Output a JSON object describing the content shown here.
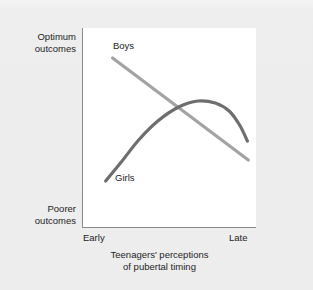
{
  "figure": {
    "background_color": "#eeeeee",
    "plot_background_color": "#ffffff",
    "axis_color": "#8a8a8a"
  },
  "axes": {
    "y_top_label_line1": "Optimum",
    "y_top_label_line2": "outcomes",
    "y_bottom_label_line1": "Poorer",
    "y_bottom_label_line2": "outcomes",
    "x_tick_left": "Early",
    "x_tick_right": "Late",
    "x_title_line1": "Teenagers' perceptions",
    "x_title_line2": "of pubertal timing"
  },
  "series_labels": {
    "boys": "Boys",
    "girls": "Girls"
  },
  "chart_data": {
    "type": "line",
    "title": "",
    "subtitle": "",
    "xlabel": "Teenagers' perceptions of pubertal timing",
    "ylabel": "Outcomes",
    "xlim": [
      0,
      1
    ],
    "ylim": [
      0,
      1
    ],
    "grid": false,
    "legend": "inline-labels",
    "xticklabels": [
      "Early",
      "Late"
    ],
    "yticklabels": [
      "Poorer outcomes",
      "Optimum outcomes"
    ],
    "annotations": [
      {
        "text": "Boys",
        "x": 0.2,
        "y": 0.9
      },
      {
        "text": "Girls",
        "x": 0.2,
        "y": 0.27
      }
    ],
    "series": [
      {
        "name": "Boys",
        "color": "#a3a3a3",
        "linewidth": 3.2,
        "shape": "straight-decreasing",
        "x": [
          0.17,
          0.3,
          0.43,
          0.56,
          0.69,
          0.82,
          0.95
        ],
        "y": [
          0.85,
          0.765,
          0.68,
          0.595,
          0.51,
          0.425,
          0.34
        ]
      },
      {
        "name": "Girls",
        "color": "#6e6e6e",
        "linewidth": 3.2,
        "shape": "inverted-u-rising-then-falling",
        "x": [
          0.13,
          0.22,
          0.32,
          0.43,
          0.55,
          0.66,
          0.76,
          0.84,
          0.9,
          0.945
        ],
        "y": [
          0.235,
          0.33,
          0.44,
          0.535,
          0.605,
          0.635,
          0.625,
          0.585,
          0.515,
          0.435
        ]
      }
    ]
  }
}
